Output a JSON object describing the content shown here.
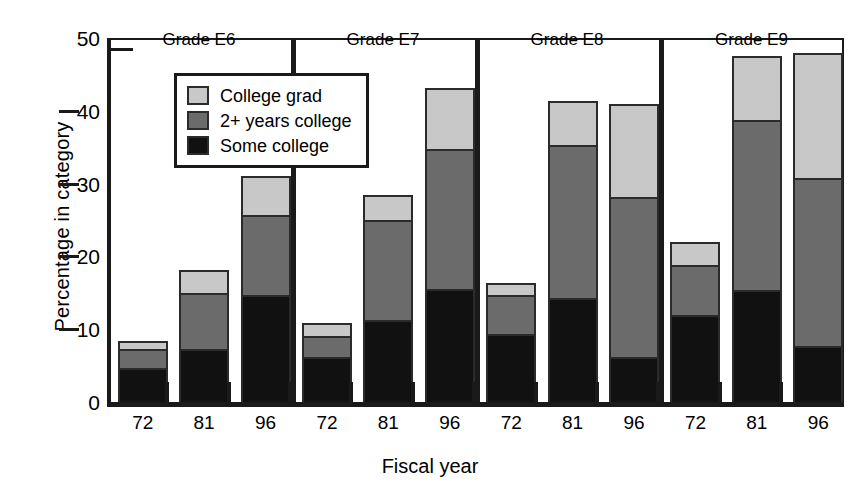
{
  "chart_data": {
    "type": "bar",
    "subtype": "stacked-grouped",
    "title": "",
    "xlabel": "Fiscal year",
    "ylabel": "Percentage in category",
    "ylim": [
      0,
      50
    ],
    "yticks": [
      0,
      10,
      20,
      30,
      40,
      50
    ],
    "ytick_labels": [
      "0",
      "10",
      "20",
      "30",
      "40",
      "50"
    ],
    "grid": false,
    "legend_position": "upper-left-inside",
    "groups": [
      "Grade E6",
      "Grade E7",
      "Grade E8",
      "Grade E9"
    ],
    "categories": [
      "72",
      "81",
      "96"
    ],
    "series": [
      {
        "name": "Some college",
        "color": "#111111",
        "values": {
          "Grade E6": [
            5.0,
            7.6,
            15.0
          ],
          "Grade E7": [
            6.4,
            11.6,
            15.8
          ],
          "Grade E8": [
            9.6,
            14.5,
            6.4
          ],
          "Grade E9": [
            12.2,
            15.6,
            8.0
          ]
        }
      },
      {
        "name": "2+ years college",
        "color": "#6b6b6b",
        "values": {
          "Grade E6": [
            2.6,
            7.7,
            11.0
          ],
          "Grade E7": [
            3.0,
            13.7,
            19.2
          ],
          "Grade E8": [
            5.4,
            21.1,
            22.0
          ],
          "Grade E9": [
            6.9,
            23.4,
            23.0
          ]
        }
      },
      {
        "name": "College grad",
        "color": "#c8c8c8",
        "values": {
          "Grade E6": [
            0.8,
            2.8,
            5.0
          ],
          "Grade E7": [
            1.4,
            3.1,
            8.2
          ],
          "Grade E8": [
            1.4,
            5.7,
            12.6
          ],
          "Grade E9": [
            2.9,
            8.5,
            16.9
          ]
        }
      }
    ],
    "stack_totals": {
      "Grade E6": [
        8.4,
        18.1,
        31.0
      ],
      "Grade E7": [
        10.8,
        28.4,
        43.2
      ],
      "Grade E8": [
        16.4,
        41.3,
        41.0
      ],
      "Grade E9": [
        22.0,
        47.5,
        47.9
      ]
    },
    "stack_boundaries": {
      "Grade E6": [
        [
          5.0,
          7.6,
          8.4
        ],
        [
          7.6,
          15.3,
          18.1
        ],
        [
          15.0,
          26.0,
          31.0
        ]
      ],
      "Grade E7": [
        [
          6.4,
          9.4,
          10.8
        ],
        [
          11.6,
          25.3,
          28.4
        ],
        [
          15.8,
          35.0,
          43.2
        ]
      ],
      "Grade E8": [
        [
          9.6,
          15.0,
          16.4
        ],
        [
          14.5,
          35.6,
          41.3
        ],
        [
          6.4,
          28.4,
          41.0
        ]
      ],
      "Grade E9": [
        [
          12.2,
          19.1,
          22.0
        ],
        [
          15.6,
          39.0,
          47.5
        ],
        [
          8.0,
          31.0,
          47.9
        ]
      ]
    }
  },
  "axes": {
    "y_title": "Percentage in category",
    "x_title": "Fiscal year",
    "y_ticks": [
      {
        "label": "50",
        "value": 50
      },
      {
        "label": "40",
        "value": 40
      },
      {
        "label": "30",
        "value": 30
      },
      {
        "label": "20",
        "value": 20
      },
      {
        "label": "10",
        "value": 10
      },
      {
        "label": "0",
        "value": 0
      }
    ],
    "x_tick_labels": [
      "72",
      "81",
      "96",
      "72",
      "81",
      "96",
      "72",
      "81",
      "96",
      "72",
      "81",
      "96"
    ]
  },
  "groups": [
    {
      "title": "Grade E6"
    },
    {
      "title": "Grade E7"
    },
    {
      "title": "Grade E8"
    },
    {
      "title": "Grade E9"
    }
  ],
  "legend": {
    "items": [
      {
        "label": "College grad",
        "color": "#c8c8c8"
      },
      {
        "label": "2+ years college",
        "color": "#6b6b6b"
      },
      {
        "label": "Some college",
        "color": "#111111"
      }
    ]
  },
  "colors": {
    "college_grad": "#c8c8c8",
    "two_years_college": "#6b6b6b",
    "some_college": "#111111",
    "axis": "#1a1a1a",
    "background": "#ffffff"
  }
}
